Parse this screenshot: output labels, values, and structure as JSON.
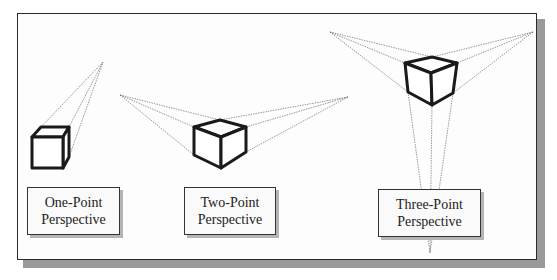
{
  "diagram": {
    "colors": {
      "frame_border": "#2a2a2a",
      "shadow": "#9a9a9a",
      "cube_stroke": "#1a1a1a",
      "vanishing_lines": "#555555"
    },
    "panels": [
      {
        "id": "one-point",
        "label_line1": "One-Point",
        "label_line2": "Perspective",
        "vanishing_points": [
          [
            103,
            62
          ]
        ]
      },
      {
        "id": "two-point",
        "label_line1": "Two-Point",
        "label_line2": "Perspective",
        "vanishing_points": [
          [
            120,
            95
          ],
          [
            348,
            97
          ]
        ]
      },
      {
        "id": "three-point",
        "label_line1": "Three-Point",
        "label_line2": "Perspective",
        "vanishing_points": [
          [
            330,
            32
          ],
          [
            533,
            32
          ],
          [
            430,
            253
          ]
        ]
      }
    ]
  }
}
